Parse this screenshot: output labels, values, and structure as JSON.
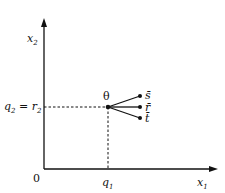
{
  "diagram": {
    "axes": {
      "x_label": "x",
      "x_sub": "1",
      "y_label": "x",
      "y_sub": "2",
      "origin_label": "0"
    },
    "ticks": {
      "x_tick": "q",
      "x_tick_sub": "1",
      "y_tick_left": "q",
      "y_tick_left_sub": "2",
      "y_tick_eq": " = ",
      "y_tick_right": "r",
      "y_tick_right_sub": "2"
    },
    "node": {
      "label": "θ"
    },
    "branches": [
      {
        "label": "s̄"
      },
      {
        "label": "r̄"
      },
      {
        "label": "t̄"
      }
    ],
    "colors": {
      "ink": "#111111",
      "background": "#ffffff"
    }
  }
}
